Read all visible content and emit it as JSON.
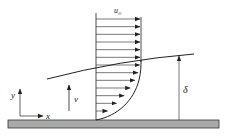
{
  "diagram": {
    "labels": {
      "free_stream_velocity": "u∞",
      "u_symbol": "u",
      "u_subscript": "∞",
      "normal_velocity": "v",
      "thickness": "δ",
      "x_axis": "x",
      "y_axis": "y"
    },
    "profile": {
      "arrow_count": 13,
      "description": "velocity arrows uniform above boundary layer, decreasing toward the wall"
    },
    "colors": {
      "line": "#222222",
      "plate_fill": "#a9a9a9",
      "plate_stroke": "#333333",
      "background": "#ffffff"
    }
  }
}
